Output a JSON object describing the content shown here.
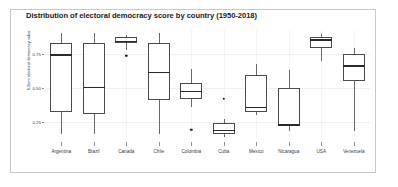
{
  "chart_data": {
    "type": "box",
    "title": "Distribution of electoral democracy score by country (1950-2018)",
    "xlabel": "",
    "ylabel": "V-Dem electoral democracy index",
    "ylim": [
      0.1,
      0.93
    ],
    "yticks": [
      0.25,
      0.5,
      0.75
    ],
    "ytick_labels": [
      "0.25",
      "0.50",
      "0.75"
    ],
    "grid": true,
    "legend": "none",
    "categories": [
      "Argentina",
      "Brazil",
      "Canada",
      "Chile",
      "Colombia",
      "Cuba",
      "Mexico",
      "Nicaragua",
      "USA",
      "Venezuela"
    ],
    "boxes": [
      {
        "category": "Argentina",
        "whisker_low": 0.16,
        "q1": 0.32,
        "median": 0.75,
        "q3": 0.83,
        "whisker_high": 0.91,
        "outliers": []
      },
      {
        "category": "Brazil",
        "whisker_low": 0.16,
        "q1": 0.31,
        "median": 0.51,
        "q3": 0.83,
        "whisker_high": 0.91,
        "outliers": []
      },
      {
        "category": "Canada",
        "whisker_low": 0.78,
        "q1": 0.83,
        "median": 0.85,
        "q3": 0.88,
        "whisker_high": 0.89,
        "outliers": [
          0.74
        ]
      },
      {
        "category": "Chile",
        "whisker_low": 0.16,
        "q1": 0.41,
        "median": 0.62,
        "q3": 0.83,
        "whisker_high": 0.91,
        "outliers": []
      },
      {
        "category": "Colombia",
        "whisker_low": 0.36,
        "q1": 0.42,
        "median": 0.48,
        "q3": 0.54,
        "whisker_high": 0.64,
        "outliers": [
          0.19
        ]
      },
      {
        "category": "Cuba",
        "whisker_low": 0.14,
        "q1": 0.16,
        "median": 0.19,
        "q3": 0.24,
        "whisker_high": 0.27,
        "outliers": [
          0.42
        ]
      },
      {
        "category": "Mexico",
        "whisker_low": 0.3,
        "q1": 0.32,
        "median": 0.36,
        "q3": 0.6,
        "whisker_high": 0.68,
        "outliers": []
      },
      {
        "category": "Nicaragua",
        "whisker_low": 0.18,
        "q1": 0.22,
        "median": 0.23,
        "q3": 0.5,
        "whisker_high": 0.63,
        "outliers": []
      },
      {
        "category": "USA",
        "whisker_low": 0.7,
        "q1": 0.8,
        "median": 0.86,
        "q3": 0.88,
        "whisker_high": 0.9,
        "outliers": []
      },
      {
        "category": "Venezuela",
        "whisker_low": 0.18,
        "q1": 0.55,
        "median": 0.67,
        "q3": 0.75,
        "whisker_high": 0.8,
        "outliers": []
      }
    ]
  }
}
